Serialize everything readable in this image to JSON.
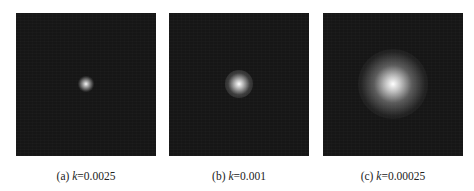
{
  "figure": {
    "panels": [
      {
        "id": "a",
        "label_prefix": "(a) ",
        "var": "k",
        "value_text": "=0.0025",
        "spot": {
          "size_px": 14,
          "description": "small bright gaussian spot"
        }
      },
      {
        "id": "b",
        "label_prefix": "(b) ",
        "var": "k",
        "value_text": "=0.001",
        "spot": {
          "size_px": 24,
          "description": "medium bright gaussian spot"
        }
      },
      {
        "id": "c",
        "label_prefix": "(c) ",
        "var": "k",
        "value_text": "=0.00025",
        "spot": {
          "size_px": 60,
          "description": "large diffuse gaussian spot"
        }
      }
    ],
    "colors": {
      "background": "#161616",
      "spot": "#ffffff"
    }
  }
}
